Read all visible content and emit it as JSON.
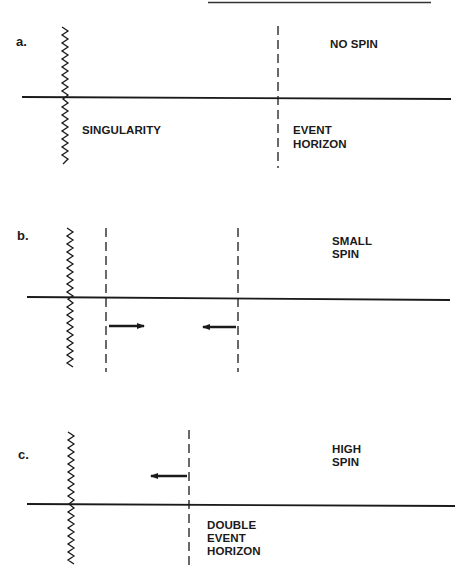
{
  "diagram": {
    "colors": {
      "ink": "#1a1a1a",
      "background": "#ffffff"
    },
    "panels": [
      {
        "id": "a",
        "letter": "a.",
        "title": "NO SPIN",
        "singularity_label": "SINGULARITY",
        "horizon_label_line1": "EVENT",
        "horizon_label_line2": "HORIZON",
        "horizons": 1,
        "arrows": []
      },
      {
        "id": "b",
        "letter": "b.",
        "title_line1": "SMALL",
        "title_line2": "SPIN",
        "horizons": 2,
        "arrows": [
          "right",
          "left"
        ]
      },
      {
        "id": "c",
        "letter": "c.",
        "title_line1": "HIGH",
        "title_line2": "SPIN",
        "horizon_label_line1": "DOUBLE",
        "horizon_label_line2": "EVENT",
        "horizon_label_line3": "HORIZON",
        "horizons": 1,
        "arrows": [
          "left"
        ]
      }
    ]
  }
}
